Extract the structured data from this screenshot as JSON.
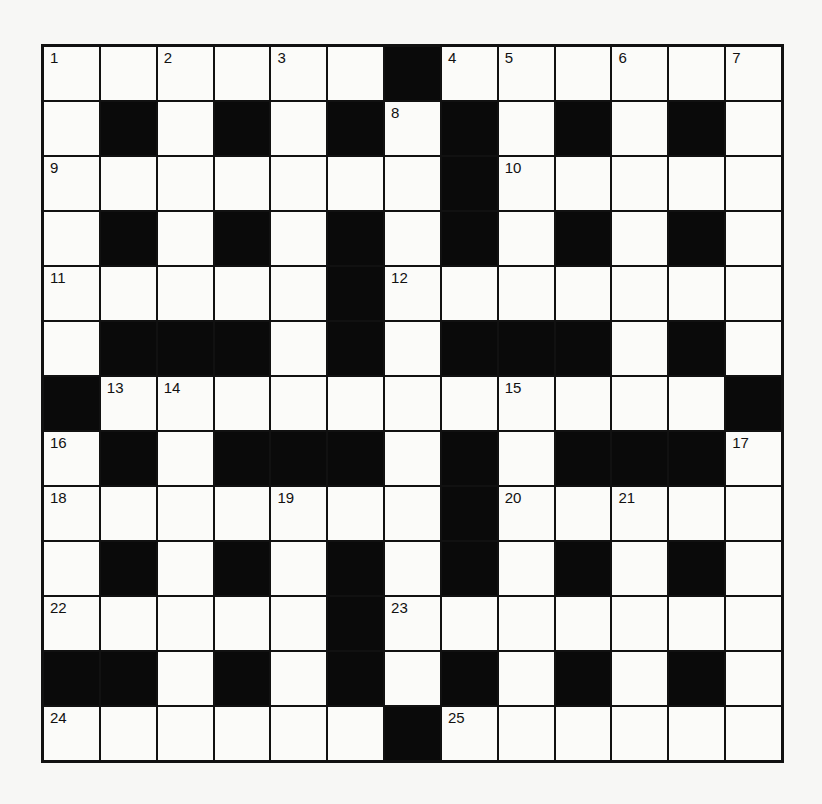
{
  "puzzle": {
    "rows": 13,
    "cols": 13,
    "colors": {
      "black": "#0a0a0a",
      "white": "#fbfbf9",
      "line": "#111111"
    },
    "grid": [
      [
        "1",
        ".",
        "2",
        ".",
        "3",
        ".",
        "#",
        "4",
        "5",
        ".",
        "6",
        ".",
        "7"
      ],
      [
        ".",
        "#",
        ".",
        "#",
        ".",
        "#",
        "8",
        "#",
        ".",
        "#",
        ".",
        "#",
        "."
      ],
      [
        "9",
        ".",
        ".",
        ".",
        ".",
        ".",
        ".",
        "#",
        "10",
        ".",
        ".",
        ".",
        "."
      ],
      [
        ".",
        "#",
        ".",
        "#",
        ".",
        "#",
        ".",
        "#",
        ".",
        "#",
        ".",
        "#",
        "."
      ],
      [
        "11",
        ".",
        ".",
        ".",
        ".",
        "#",
        "12",
        ".",
        ".",
        ".",
        ".",
        ".",
        "."
      ],
      [
        ".",
        "#",
        "#",
        "#",
        ".",
        "#",
        ".",
        "#",
        "#",
        "#",
        ".",
        "#",
        "."
      ],
      [
        "#",
        "13",
        "14",
        ".",
        ".",
        ".",
        ".",
        ".",
        "15",
        ".",
        ".",
        ".",
        "#"
      ],
      [
        "16",
        "#",
        ".",
        "#",
        "#",
        "#",
        ".",
        "#",
        ".",
        "#",
        "#",
        "#",
        "17"
      ],
      [
        "18",
        ".",
        ".",
        ".",
        "19",
        ".",
        ".",
        "#",
        "20",
        ".",
        "21",
        ".",
        "."
      ],
      [
        ".",
        "#",
        ".",
        "#",
        ".",
        "#",
        ".",
        "#",
        ".",
        "#",
        ".",
        "#",
        "."
      ],
      [
        "22",
        ".",
        ".",
        ".",
        ".",
        "#",
        "23",
        ".",
        ".",
        ".",
        ".",
        ".",
        "."
      ],
      [
        "#",
        "#",
        ".",
        "#",
        ".",
        "#",
        ".",
        "#",
        ".",
        "#",
        ".",
        "#",
        "."
      ],
      [
        "24",
        ".",
        ".",
        ".",
        ".",
        ".",
        "#",
        "25",
        ".",
        ".",
        ".",
        ".",
        "."
      ]
    ],
    "clue_numbers": [
      1,
      2,
      3,
      4,
      5,
      6,
      7,
      8,
      9,
      10,
      11,
      12,
      13,
      14,
      15,
      16,
      17,
      18,
      19,
      20,
      21,
      22,
      23,
      24,
      25
    ]
  }
}
